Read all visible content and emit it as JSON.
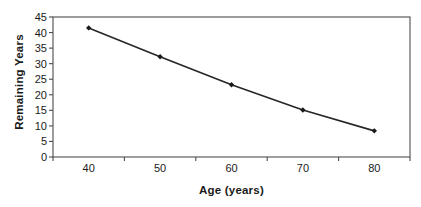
{
  "chart_data": {
    "type": "line",
    "title": "",
    "xlabel": "Age (years)",
    "ylabel": "Remaining Years",
    "categories": [
      "40",
      "50",
      "60",
      "70",
      "80"
    ],
    "x": [
      40,
      50,
      60,
      70,
      80
    ],
    "values": [
      41.5,
      32.2,
      23.2,
      15.1,
      8.4
    ],
    "series": [
      {
        "name": "Remaining Years",
        "values": [
          41.5,
          32.2,
          23.2,
          15.1,
          8.4
        ]
      }
    ],
    "ylim": [
      0,
      45
    ],
    "ytick_step": 5,
    "yticks": [
      "0",
      "5",
      "10",
      "15",
      "20",
      "25",
      "30",
      "35",
      "40",
      "45"
    ],
    "xticks": [
      "40",
      "50",
      "60",
      "70",
      "80"
    ],
    "grid": false,
    "legend": false,
    "legend_position": "none",
    "marker": "diamond",
    "line_color": "#262626",
    "marker_color": "#1a1a1a",
    "plot_background": "#ffffff",
    "axis_color": "#4d4d4d"
  }
}
